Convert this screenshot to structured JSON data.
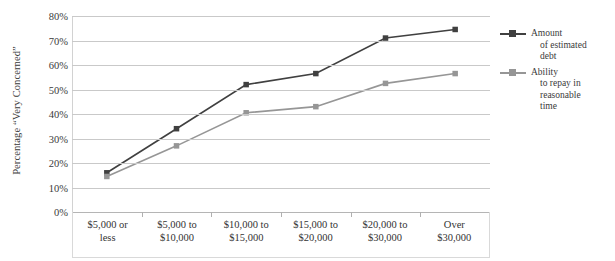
{
  "chart_data": {
    "type": "line",
    "title": "",
    "xlabel": "",
    "ylabel": "Percentage “Very Concerned”",
    "ylim": [
      0,
      80
    ],
    "yticks": [
      "0%",
      "10%",
      "20%",
      "30%",
      "40%",
      "50%",
      "60%",
      "70%",
      "80%"
    ],
    "ytick_values": [
      0,
      10,
      20,
      30,
      40,
      50,
      60,
      70,
      80
    ],
    "grid": true,
    "legend_position": "right",
    "categories": [
      "$5,000 or less",
      "$5,000 to $10,000",
      "$10,000 to $15,000",
      "$15,000 to $20,000",
      "$20,000 to $30,000",
      "Over $30,000"
    ],
    "category_lines": [
      [
        "$5,000 or",
        "less"
      ],
      [
        "$5,000 to",
        "$10,000"
      ],
      [
        "$10,000 to",
        "$15,000"
      ],
      [
        "$15,000 to",
        "$20,000"
      ],
      [
        "$20,000 to",
        "$30,000"
      ],
      [
        "Over",
        "$30,000"
      ]
    ],
    "series": [
      {
        "name": "Amount of estimated debt",
        "name_lines": [
          "Amount",
          "of estimated",
          "debt"
        ],
        "color": "#404040",
        "marker": "square",
        "values": [
          16,
          34,
          52,
          56.5,
          71,
          74.5
        ]
      },
      {
        "name": "Ability to repay in reasonable time",
        "name_lines": [
          "Ability",
          "to repay in",
          "reasonable",
          "time"
        ],
        "color": "#969696",
        "marker": "square",
        "values": [
          14.5,
          27,
          40.5,
          43,
          52.5,
          56.5
        ]
      }
    ]
  }
}
